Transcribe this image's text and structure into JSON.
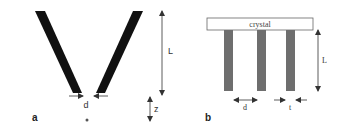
{
  "panel_a": {
    "label": "a",
    "length_label": "L",
    "gap_label": "d",
    "distance_label": "z",
    "colors": {
      "bars": "#111111",
      "arrows": "#333333"
    }
  },
  "panel_b": {
    "label": "b",
    "crystal_label": "crystal",
    "length_label": "L",
    "spacing_label": "d",
    "thickness_label": "t",
    "colors": {
      "bars": "#6e6e6e",
      "crystal_fill": "#ffffff",
      "arrows": "#333333"
    }
  }
}
